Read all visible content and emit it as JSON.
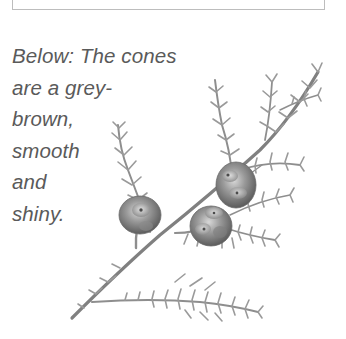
{
  "caption": {
    "lines": [
      "Below: The cones",
      "are a grey-",
      "brown,",
      "smooth",
      "and",
      "shiny."
    ]
  },
  "illustration": {
    "subject": "cypress-branch-with-cones",
    "cone_count": 3,
    "colors": {
      "foliage": "#8a8a8a",
      "cone_dark": "#6e6e6e",
      "cone_light": "#c8c8c8"
    }
  },
  "top_box": {
    "border_color": "#bdbdbd"
  }
}
